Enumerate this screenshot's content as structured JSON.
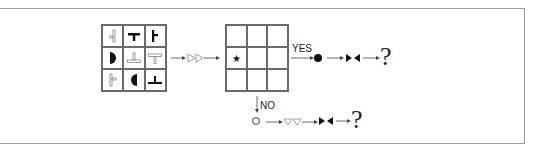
{
  "diagram": {
    "input_grid": {
      "rows": 3,
      "cols": 3,
      "cells": [
        {
          "shape": "small-side-tee-outline-left"
        },
        {
          "shape": "down-tee-bold"
        },
        {
          "shape": "right-tee-bold"
        },
        {
          "shape": "half-circle-left-filled"
        },
        {
          "shape": "up-tee-outline"
        },
        {
          "shape": "down-tee-outline"
        },
        {
          "shape": "right-tee-outline"
        },
        {
          "shape": "half-circle-right-filled"
        },
        {
          "shape": "up-tee-bold"
        }
      ]
    },
    "transform_symbol": "▷▷",
    "output_grid": {
      "rows": 3,
      "cols": 3,
      "marked_cell": {
        "row": 1,
        "col": 0,
        "symbol": "★"
      }
    },
    "yes_branch": {
      "label": "YES",
      "node": "●",
      "operator": "▸◂",
      "result": "?"
    },
    "no_branch": {
      "label": "NO",
      "node": "○",
      "transform": "▽▽",
      "operator": "▸◂",
      "result": "?"
    }
  }
}
